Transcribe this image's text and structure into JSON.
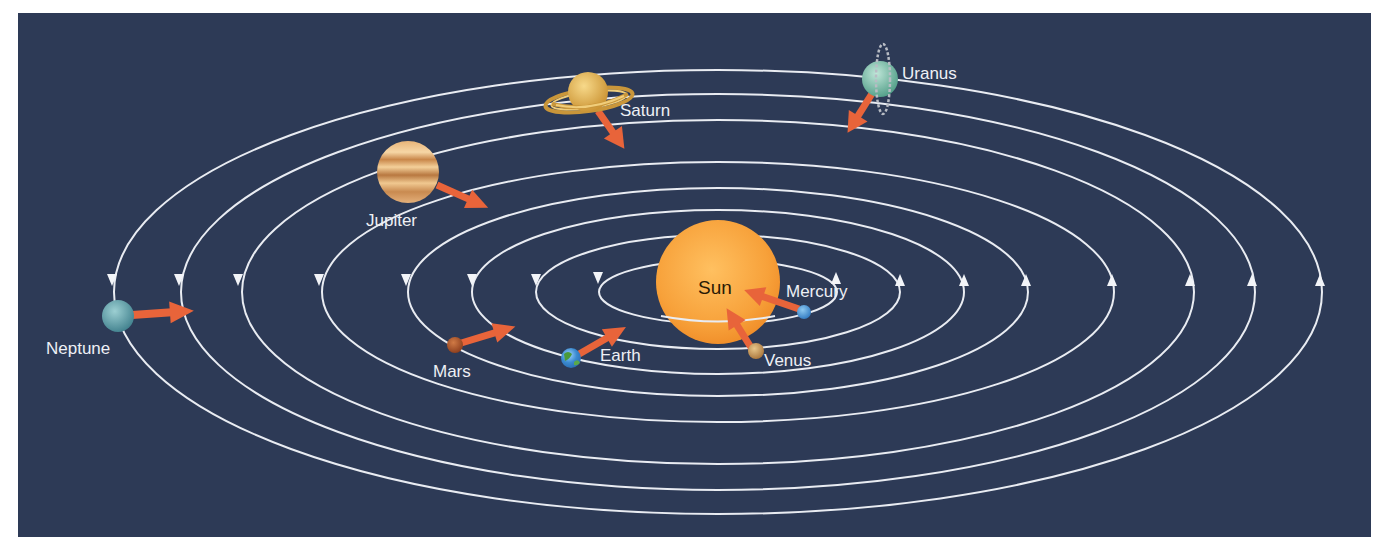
{
  "diagram": {
    "type": "solar-system-orbits",
    "background_color": "#2d3a56",
    "orbit_color": "#e9ecf2",
    "motion_arrow_color": "#e8643a",
    "orbit_direction": "counterclockwise",
    "center": {
      "name": "Sun",
      "label": "Sun",
      "color": "#f7a13a"
    },
    "planets": [
      {
        "name": "Mercury",
        "label": "Mercury",
        "color": "#4a9bd8",
        "order": 1
      },
      {
        "name": "Venus",
        "label": "Venus",
        "color": "#c89a5a",
        "order": 2
      },
      {
        "name": "Earth",
        "label": "Earth",
        "color": "#3a8ad0",
        "order": 3
      },
      {
        "name": "Mars",
        "label": "Mars",
        "color": "#b0552a",
        "order": 4
      },
      {
        "name": "Jupiter",
        "label": "Jupiter",
        "color": "#d9a060",
        "order": 5
      },
      {
        "name": "Saturn",
        "label": "Saturn",
        "color": "#e3b455",
        "order": 6
      },
      {
        "name": "Uranus",
        "label": "Uranus",
        "color": "#7fbfae",
        "order": 7
      },
      {
        "name": "Neptune",
        "label": "Neptune",
        "color": "#5e9ea8",
        "order": 8
      }
    ]
  }
}
